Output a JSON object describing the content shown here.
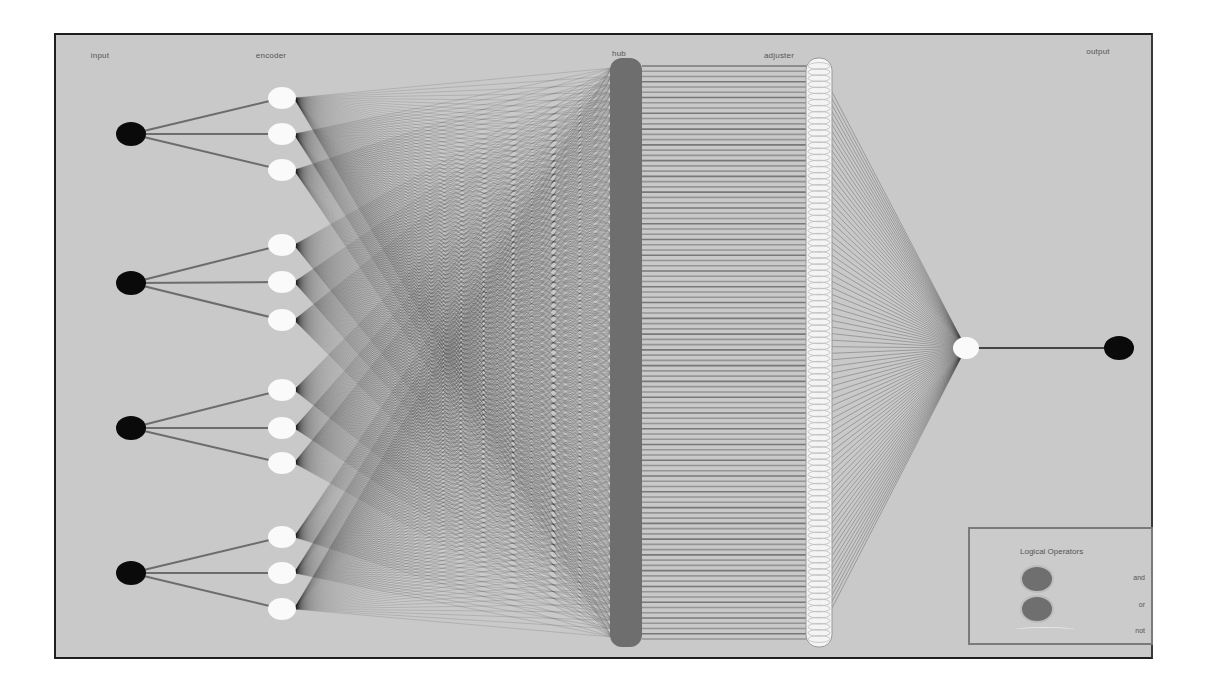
{
  "diagram": {
    "type": "neural-network",
    "background": "#c9c9c9",
    "layers": [
      {
        "id": "input",
        "label": "input",
        "label_x": 100,
        "x": 131,
        "node_color": "#0a0a0a",
        "nodes_y": [
          134,
          283,
          428,
          573
        ]
      },
      {
        "id": "encoder",
        "label": "encoder",
        "label_x": 271,
        "x": 282,
        "node_color": "#fafafa",
        "nodes_y": [
          98,
          134,
          170,
          245,
          282,
          320,
          390,
          428,
          463,
          537,
          573,
          609
        ]
      },
      {
        "id": "hub",
        "label": "hub",
        "label_x": 619,
        "x": 626,
        "bar_color": "#6e6e6e",
        "bar_top": 58,
        "bar_bottom": 647
      },
      {
        "id": "adjuster",
        "label": "adjuster",
        "label_x": 779,
        "x": 819,
        "node_color": "#f4f4f4",
        "column_top": 58,
        "column_bottom": 647
      },
      {
        "id": "merge",
        "x": 966,
        "node_color": "#fafafa",
        "nodes_y": [
          348
        ]
      },
      {
        "id": "output",
        "label": "output",
        "label_x": 1098,
        "x": 1119,
        "node_color": "#0a0a0a",
        "nodes_y": [
          348
        ]
      }
    ],
    "hub_adjuster_line_color": "#8c8c8c",
    "connection_color": "#1a1a1a"
  },
  "legend": {
    "title": "Logical Operators",
    "items": [
      {
        "label": "and",
        "color": "#6f6f6f"
      },
      {
        "label": "or",
        "color": "#6f6f6f"
      },
      {
        "label": "not",
        "color": "#c9c9c9"
      }
    ]
  }
}
